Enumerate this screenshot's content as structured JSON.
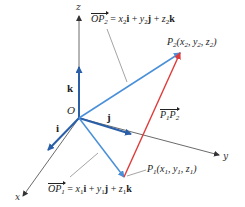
{
  "diagram": {
    "type": "3d-vector-diagram",
    "axes": {
      "x_label": "x",
      "y_label": "y",
      "z_label": "z"
    },
    "origin_label": "O",
    "unit_vectors": {
      "i": "i",
      "j": "j",
      "k": "k"
    },
    "points": {
      "p1": {
        "name": "P",
        "sub": "1",
        "coords": [
          "x",
          "1",
          "y",
          "1",
          "z",
          "1"
        ]
      },
      "p2": {
        "name": "P",
        "sub": "2",
        "coords": [
          "x",
          "2",
          "y",
          "2",
          "z",
          "2"
        ]
      }
    },
    "equations": {
      "op2": {
        "vec": "OP",
        "vec_sub": "2",
        "rhs": [
          "x",
          "2",
          "i",
          "y",
          "2",
          "j",
          "z",
          "2",
          "k"
        ]
      },
      "op1": {
        "vec": "OP",
        "vec_sub": "1",
        "rhs": [
          "x",
          "1",
          "i",
          "y",
          "1",
          "j",
          "z",
          "1",
          "k"
        ]
      }
    },
    "difference_vector": {
      "a": "P",
      "a_sub": "1",
      "b": "P",
      "b_sub": "2"
    },
    "colors": {
      "axis": "#333333",
      "unit_vector": "#2a5fa8",
      "position_vector": "#4a90d9",
      "difference_vector": "#e03a3a",
      "leader": "#555555"
    }
  }
}
